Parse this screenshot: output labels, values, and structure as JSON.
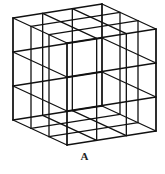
{
  "figure": {
    "type": "wireframe-cube-3x3x3",
    "label": "A",
    "divisions": 3,
    "line_color": "#111111",
    "vertices": {
      "top_left": [
        13,
        18
      ],
      "top_front": [
        67,
        43
      ],
      "top_right": [
        155,
        29
      ],
      "top_back": [
        102,
        4
      ],
      "height": 102
    }
  }
}
